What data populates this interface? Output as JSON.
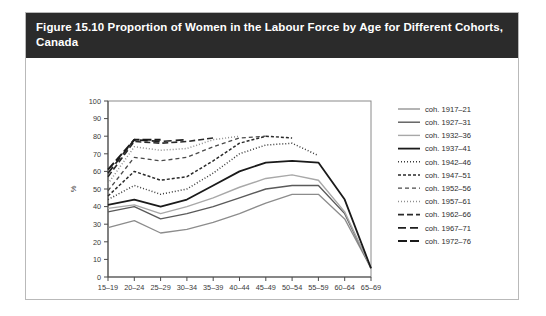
{
  "figure": {
    "title": "Figure 15.10 Proportion of Women in the Labour Force by Age for Different Cohorts, Canada"
  },
  "chart_data": {
    "type": "line",
    "title": "Figure 15.10 Proportion of Women in the Labour Force by Age for Different Cohorts, Canada",
    "xlabel": "",
    "ylabel": "%",
    "ylim": [
      0,
      100
    ],
    "ytick_labels": [
      "0",
      "10",
      "20",
      "30",
      "40",
      "50",
      "60",
      "70",
      "80",
      "90",
      "100"
    ],
    "yticks": [
      0,
      10,
      20,
      30,
      40,
      50,
      60,
      70,
      80,
      90,
      100
    ],
    "grid": false,
    "legend_position": "right",
    "categories": [
      "15–19",
      "20–24",
      "25–29",
      "30–34",
      "35–39",
      "40–44",
      "45–49",
      "50–54",
      "55–59",
      "60–64",
      "65–69"
    ],
    "series": [
      {
        "name": "coh. 1917–21",
        "color": "#8c8c8c",
        "dash": "none",
        "width": 1.3,
        "values": [
          28,
          32,
          25,
          27,
          31,
          36,
          42,
          47,
          47,
          33,
          5
        ]
      },
      {
        "name": "coh. 1927–31",
        "color": "#5a5a5a",
        "dash": "none",
        "width": 1.4,
        "values": [
          37,
          40,
          33,
          36,
          40,
          45,
          50,
          52,
          52,
          36,
          5
        ]
      },
      {
        "name": "coh. 1932–36",
        "color": "#a8a8a8",
        "dash": "none",
        "width": 1.4,
        "values": [
          39,
          41,
          36,
          40,
          45,
          51,
          56,
          58,
          55,
          37,
          5
        ]
      },
      {
        "name": "coh. 1937–41",
        "color": "#1a1a1a",
        "dash": "none",
        "width": 1.8,
        "values": [
          41,
          44,
          40,
          44,
          52,
          60,
          65,
          66,
          65,
          44,
          5
        ]
      },
      {
        "name": "coh. 1942–46",
        "color": "#3a3a3a",
        "dash": "1,2",
        "width": 1.5,
        "values": [
          44,
          52,
          47,
          50,
          59,
          70,
          75,
          76,
          69,
          null,
          null
        ]
      },
      {
        "name": "coh. 1947–51",
        "color": "#2a2a2a",
        "dash": "3,2",
        "width": 1.5,
        "values": [
          46,
          60,
          55,
          57,
          66,
          76,
          80,
          79,
          null,
          null,
          null
        ]
      },
      {
        "name": "coh. 1952–56",
        "color": "#4a4a4a",
        "dash": "4,3",
        "width": 1.3,
        "values": [
          49,
          68,
          66,
          68,
          74,
          79,
          80,
          null,
          null,
          null,
          null
        ]
      },
      {
        "name": "coh. 1957–61",
        "color": "#8f8f8f",
        "dash": "1,2",
        "width": 1.5,
        "values": [
          53,
          74,
          72,
          73,
          78,
          80,
          null,
          null,
          null,
          null,
          null
        ]
      },
      {
        "name": "coh. 1962–66",
        "color": "#2a2a2a",
        "dash": "6,3",
        "width": 1.6,
        "values": [
          57,
          77,
          76,
          77,
          79,
          null,
          null,
          null,
          null,
          null,
          null
        ]
      },
      {
        "name": "coh. 1967–71",
        "color": "#1f1f1f",
        "dash": "8,4",
        "width": 1.7,
        "values": [
          59,
          78,
          77,
          78,
          null,
          null,
          null,
          null,
          null,
          null,
          null
        ]
      },
      {
        "name": "coh. 1972–76",
        "color": "#1a1a1a",
        "dash": "9,3",
        "width": 2.0,
        "values": [
          61,
          78,
          78,
          null,
          null,
          null,
          null,
          null,
          null,
          null,
          null
        ]
      }
    ]
  }
}
